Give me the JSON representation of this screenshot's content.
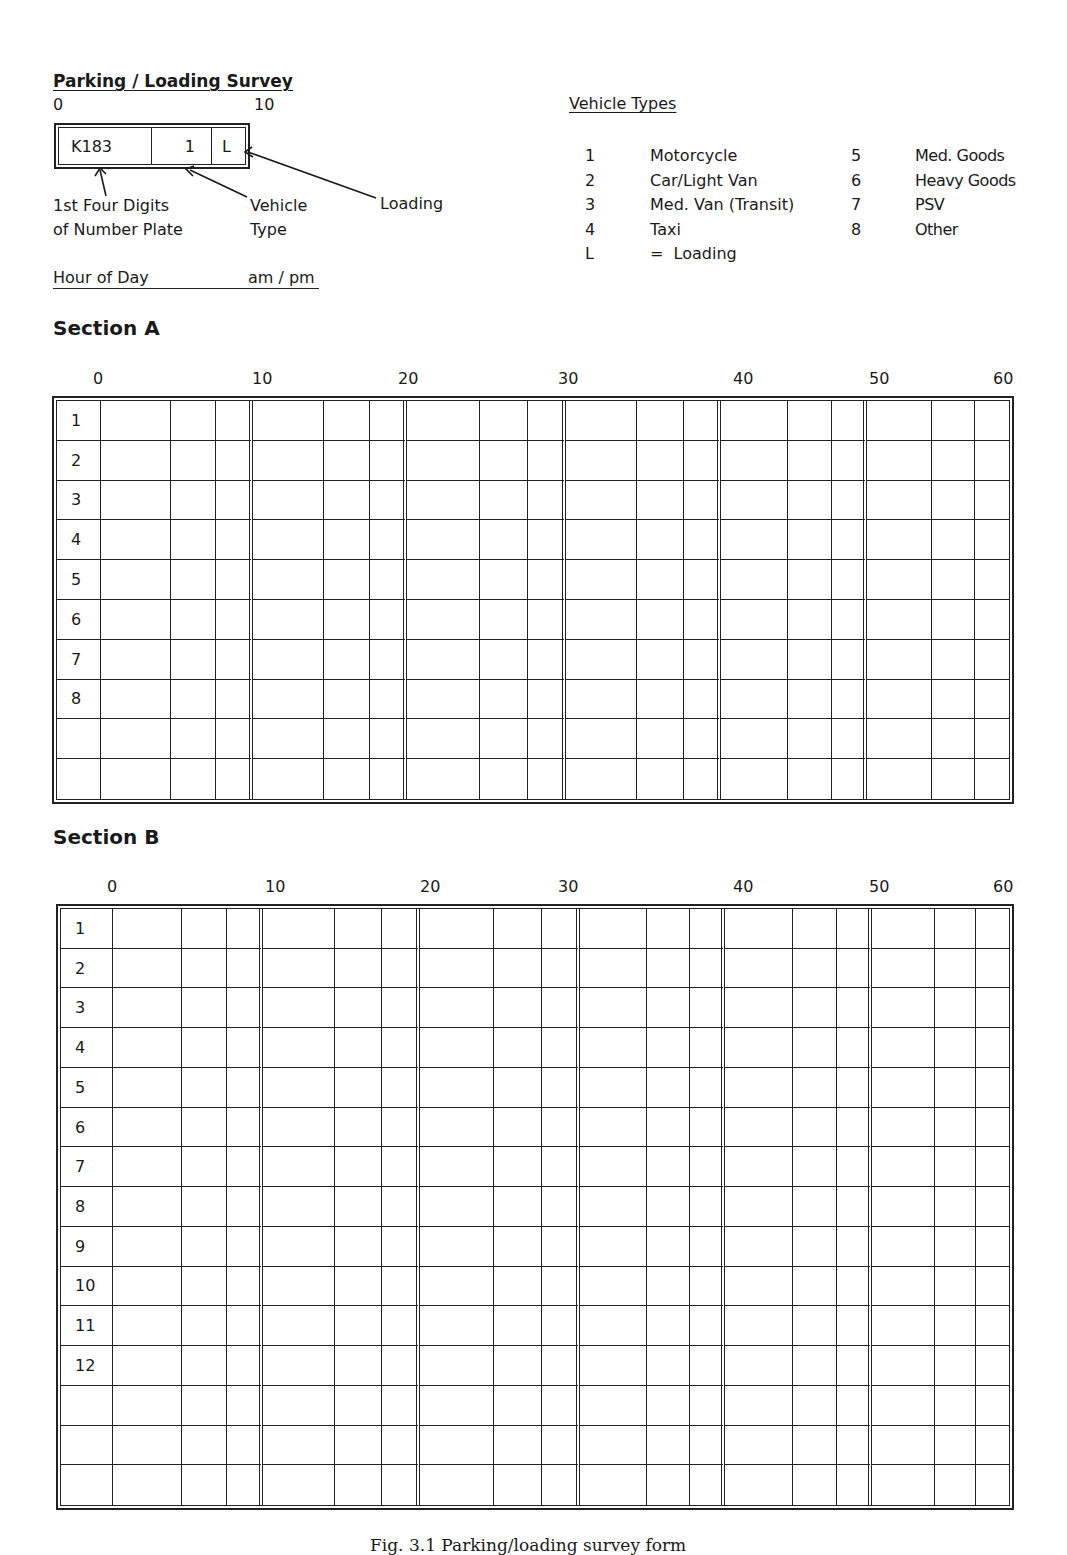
{
  "form": {
    "title": "Parking / Loading Survey",
    "example": {
      "scale_start": "0",
      "scale_end": "10",
      "plate_value": "K183",
      "type_value": "1",
      "loading_value": "L",
      "label_plate_line1": "1st Four Digits",
      "label_plate_line2": "of Number Plate",
      "label_type_line1": "Vehicle",
      "label_type_line2": "Type",
      "label_loading": "Loading"
    },
    "hour_of_day_label": "Hour of Day",
    "am_pm_label": "am / pm"
  },
  "vehicle_types": {
    "title": "Vehicle Types",
    "left": [
      {
        "code": "1",
        "name": "Motorcycle"
      },
      {
        "code": "2",
        "name": "Car/Light Van"
      },
      {
        "code": "3",
        "name": "Med. Van (Transit)"
      },
      {
        "code": "4",
        "name": "Taxi"
      },
      {
        "code": "L",
        "name": "=  Loading"
      }
    ],
    "right": [
      {
        "code": "5",
        "name": "Med. Goods"
      },
      {
        "code": "6",
        "name": "Heavy Goods"
      },
      {
        "code": "7",
        "name": "PSV"
      },
      {
        "code": "8",
        "name": "Other"
      }
    ]
  },
  "minute_ticks": [
    "0",
    "10",
    "20",
    "30",
    "40",
    "50",
    "60"
  ],
  "section_a": {
    "title": "Section A",
    "row_labels": [
      "1",
      "2",
      "3",
      "4",
      "5",
      "6",
      "7",
      "8",
      "",
      ""
    ]
  },
  "section_b": {
    "title": "Section B",
    "row_labels": [
      "1",
      "2",
      "3",
      "4",
      "5",
      "6",
      "7",
      "8",
      "9",
      "10",
      "11",
      "12",
      "",
      "",
      ""
    ]
  },
  "caption": "Fig. 3.1  Parking/loading survey form"
}
